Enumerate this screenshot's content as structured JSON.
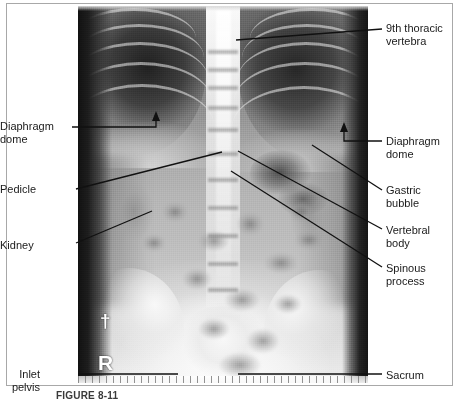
{
  "figure": {
    "caption": "FIGURE 8-11",
    "modality": "radiograph",
    "view": "abdominal / lower thoracic AP plain film",
    "frame_color": "#a8a8a8",
    "label_color": "#1a1a1a",
    "leader_color": "#111111"
  },
  "film_markers": [
    {
      "name": "pin-marker",
      "text": "†",
      "note": "small white radiopaque pin marker"
    },
    {
      "name": "right-side-marker",
      "text": "R",
      "note": "radiopaque right-side letter marker"
    }
  ],
  "annotations": [
    {
      "id": "ninth-thoracic-vertebra",
      "label": "9th thoracic\nvertebra",
      "side": "right",
      "label_x": 386,
      "label_y": 22,
      "leader": {
        "x1": 382,
        "y1": 29,
        "x2": 236,
        "y2": 40
      },
      "arrow": false
    },
    {
      "id": "diaphragm-dome-left",
      "label": "Diaphragm\ndome",
      "side": "left",
      "label_x": 12,
      "label_y": 120,
      "leader": {
        "x1": 72,
        "y1": 127,
        "x2": 156,
        "y2": 127
      },
      "arrow": true,
      "arrow_dir": "up",
      "arrow_x": 156,
      "arrow_y": 112
    },
    {
      "id": "diaphragm-dome-right",
      "label": "Diaphragm\ndome",
      "side": "right",
      "label_x": 386,
      "label_y": 135,
      "leader": {
        "x1": 382,
        "y1": 141,
        "x2": 344,
        "y2": 141
      },
      "arrow": true,
      "arrow_dir": "up",
      "arrow_x": 344,
      "arrow_y": 123
    },
    {
      "id": "pedicle",
      "label": "Pedicle",
      "side": "left",
      "label_x": 26,
      "label_y": 183,
      "leader": {
        "x1": 76,
        "y1": 189,
        "x2": 222,
        "y2": 152
      },
      "arrow": false
    },
    {
      "id": "kidney",
      "label": "Kidney",
      "side": "left",
      "label_x": 28,
      "label_y": 239,
      "leader": {
        "x1": 76,
        "y1": 243,
        "x2": 152,
        "y2": 211
      },
      "arrow": false
    },
    {
      "id": "gastric-bubble",
      "label": "Gastric\nbubble",
      "side": "right",
      "label_x": 386,
      "label_y": 184,
      "leader": {
        "x1": 382,
        "y1": 190,
        "x2": 312,
        "y2": 145
      },
      "arrow": false
    },
    {
      "id": "vertebral-body",
      "label": "Vertebral\nbody",
      "side": "right",
      "label_x": 386,
      "label_y": 224,
      "leader": {
        "x1": 382,
        "y1": 229,
        "x2": 238,
        "y2": 151
      },
      "arrow": false
    },
    {
      "id": "spinous-process",
      "label": "Spinous\nprocess",
      "side": "right",
      "label_x": 386,
      "label_y": 262,
      "leader": {
        "x1": 382,
        "y1": 267,
        "x2": 231,
        "y2": 171
      },
      "arrow": false
    },
    {
      "id": "inlet-pelvis",
      "label": "Inlet\npelvis",
      "side": "left",
      "label_x": 40,
      "label_y": 368,
      "leader": {
        "x1": 78,
        "y1": 374,
        "x2": 178,
        "y2": 374
      },
      "arrow": false
    },
    {
      "id": "sacrum",
      "label": "Sacrum",
      "side": "right",
      "label_x": 386,
      "label_y": 369,
      "leader": {
        "x1": 382,
        "y1": 374,
        "x2": 238,
        "y2": 374
      },
      "arrow": false
    }
  ]
}
